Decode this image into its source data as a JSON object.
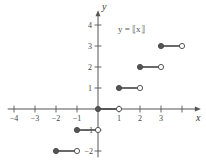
{
  "chart_data": {
    "type": "line",
    "title": "y = ⟦x⟧",
    "xlabel": "x",
    "ylabel": "y",
    "xlim": [
      -4.3,
      4.9
    ],
    "ylim": [
      -2.3,
      4.7
    ],
    "grid": false,
    "x_ticks": [
      -4,
      -3,
      -2,
      -1,
      1,
      2,
      3,
      4
    ],
    "x_tick_labels": [
      "−4",
      "−3",
      "−2",
      "−1",
      "1",
      "2",
      "3",
      ""
    ],
    "y_ticks": [
      -2,
      -1,
      1,
      2,
      3,
      4
    ],
    "y_tick_labels": [
      "−2",
      "−1",
      "1",
      "2",
      "3",
      "4"
    ],
    "segments": [
      {
        "x_start": -2,
        "x_end": -1,
        "y": -2,
        "start_closed": true,
        "end_closed": false
      },
      {
        "x_start": -1,
        "x_end": 0,
        "y": -1,
        "start_closed": true,
        "end_closed": false
      },
      {
        "x_start": 0,
        "x_end": 1,
        "y": 0,
        "start_closed": true,
        "end_closed": false
      },
      {
        "x_start": 1,
        "x_end": 2,
        "y": 1,
        "start_closed": true,
        "end_closed": false
      },
      {
        "x_start": 2,
        "x_end": 3,
        "y": 2,
        "start_closed": true,
        "end_closed": false
      },
      {
        "x_start": 3,
        "x_end": 4,
        "y": 3,
        "start_closed": true,
        "end_closed": false
      }
    ],
    "colors": {
      "axis": "#555555",
      "segment": "#444444",
      "closed_dot": "#555555",
      "open_dot_fill": "#ffffff"
    }
  }
}
